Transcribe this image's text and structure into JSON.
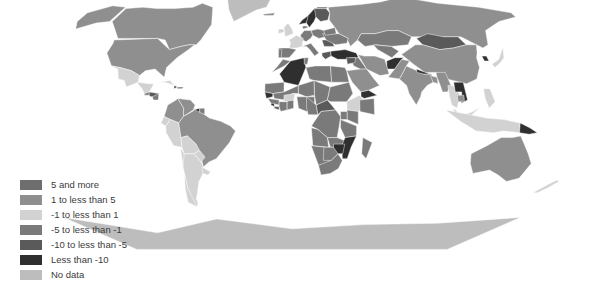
{
  "figure": {
    "title": "(Percentage)",
    "width": 609,
    "height": 292,
    "background": "#ffffff",
    "type": "choropleth-world-map",
    "projection": "robinson"
  },
  "legend": {
    "name": "map-legend",
    "items": [
      {
        "label": "5 and more",
        "color": "#6e6e6e",
        "key": "ge5"
      },
      {
        "label": "1 to less than 5",
        "color": "#8f8f8f",
        "key": "1to5"
      },
      {
        "label": "-1 to less than 1",
        "color": "#d2d2d2",
        "key": "m1to1"
      },
      {
        "label": "-5 to less than -1",
        "color": "#7a7a7a",
        "key": "m5tom1"
      },
      {
        "label": "-10 to less than -5",
        "color": "#5a5a5a",
        "key": "m10tom5"
      },
      {
        "label": "Less than -10",
        "color": "#2f2f2f",
        "key": "ltm10"
      },
      {
        "label": "No data",
        "color": "#bdbdbd",
        "key": "nodata"
      }
    ]
  },
  "chart_data": {
    "type": "heatmap",
    "title": "(Percentage)",
    "xlabel": "",
    "ylabel": "",
    "legend_position": "bottom-left",
    "grid": false,
    "color_scale": [
      {
        "bin": "5 and more",
        "color": "#6e6e6e"
      },
      {
        "bin": "1 to less than 5",
        "color": "#8f8f8f"
      },
      {
        "bin": "-1 to less than 1",
        "color": "#d2d2d2"
      },
      {
        "bin": "-5 to less than -1",
        "color": "#7a7a7a"
      },
      {
        "bin": "-10 to less than -5",
        "color": "#5a5a5a"
      },
      {
        "bin": "Less than -10",
        "color": "#2f2f2f"
      },
      {
        "bin": "No data",
        "color": "#bdbdbd"
      }
    ],
    "regions": [
      {
        "name": "Canada",
        "bin": "1 to less than 5",
        "color": "#8f8f8f"
      },
      {
        "name": "United States",
        "bin": "1 to less than 5",
        "color": "#8f8f8f"
      },
      {
        "name": "Greenland",
        "bin": "No data",
        "color": "#bdbdbd"
      },
      {
        "name": "Mexico",
        "bin": "-1 to less than 1",
        "color": "#d2d2d2"
      },
      {
        "name": "Guatemala",
        "bin": "-5 to less than -1",
        "color": "#7a7a7a"
      },
      {
        "name": "Honduras",
        "bin": "-10 to less than -5",
        "color": "#5a5a5a"
      },
      {
        "name": "Nicaragua",
        "bin": "-5 to less than -1",
        "color": "#7a7a7a"
      },
      {
        "name": "Cuba",
        "bin": "-1 to less than 1",
        "color": "#d2d2d2"
      },
      {
        "name": "Haiti",
        "bin": "Less than -10",
        "color": "#2f2f2f"
      },
      {
        "name": "Dominican Republic",
        "bin": "-5 to less than -1",
        "color": "#7a7a7a"
      },
      {
        "name": "Colombia",
        "bin": "1 to less than 5",
        "color": "#8f8f8f"
      },
      {
        "name": "Venezuela",
        "bin": "1 to less than 5",
        "color": "#8f8f8f"
      },
      {
        "name": "Guyana",
        "bin": "Less than -10",
        "color": "#2f2f2f"
      },
      {
        "name": "Suriname",
        "bin": "-5 to less than -1",
        "color": "#7a7a7a"
      },
      {
        "name": "Ecuador",
        "bin": "-1 to less than 1",
        "color": "#d2d2d2"
      },
      {
        "name": "Peru",
        "bin": "-1 to less than 1",
        "color": "#d2d2d2"
      },
      {
        "name": "Brazil",
        "bin": "1 to less than 5",
        "color": "#8f8f8f"
      },
      {
        "name": "Bolivia",
        "bin": "-1 to less than 1",
        "color": "#d2d2d2"
      },
      {
        "name": "Paraguay",
        "bin": "-1 to less than 1",
        "color": "#d2d2d2"
      },
      {
        "name": "Chile",
        "bin": "-1 to less than 1",
        "color": "#d2d2d2"
      },
      {
        "name": "Argentina",
        "bin": "-1 to less than 1",
        "color": "#d2d2d2"
      },
      {
        "name": "Uruguay",
        "bin": "-1 to less than 1",
        "color": "#d2d2d2"
      },
      {
        "name": "Iceland",
        "bin": "1 to less than 5",
        "color": "#8f8f8f"
      },
      {
        "name": "Norway",
        "bin": "Less than -10",
        "color": "#2f2f2f"
      },
      {
        "name": "Sweden",
        "bin": "Less than -10",
        "color": "#2f2f2f"
      },
      {
        "name": "Finland",
        "bin": "-10 to less than -5",
        "color": "#5a5a5a"
      },
      {
        "name": "United Kingdom",
        "bin": "-1 to less than 1",
        "color": "#d2d2d2"
      },
      {
        "name": "Ireland",
        "bin": "-1 to less than 1",
        "color": "#d2d2d2"
      },
      {
        "name": "Denmark",
        "bin": "-5 to less than -1",
        "color": "#7a7a7a"
      },
      {
        "name": "Germany",
        "bin": "-5 to less than -1",
        "color": "#7a7a7a"
      },
      {
        "name": "Poland",
        "bin": "-5 to less than -1",
        "color": "#7a7a7a"
      },
      {
        "name": "France",
        "bin": "-1 to less than 1",
        "color": "#d2d2d2"
      },
      {
        "name": "Spain",
        "bin": "-5 to less than -1",
        "color": "#7a7a7a"
      },
      {
        "name": "Portugal",
        "bin": "-5 to less than -1",
        "color": "#7a7a7a"
      },
      {
        "name": "Italy",
        "bin": "-5 to less than -1",
        "color": "#7a7a7a"
      },
      {
        "name": "Greece",
        "bin": "-10 to less than -5",
        "color": "#5a5a5a"
      },
      {
        "name": "Romania",
        "bin": "-10 to less than -5",
        "color": "#5a5a5a"
      },
      {
        "name": "Ukraine",
        "bin": "-5 to less than -1",
        "color": "#7a7a7a"
      },
      {
        "name": "Belarus",
        "bin": "-5 to less than -1",
        "color": "#7a7a7a"
      },
      {
        "name": "Turkey",
        "bin": "Less than -10",
        "color": "#2f2f2f"
      },
      {
        "name": "Russian Federation",
        "bin": "1 to less than 5",
        "color": "#8f8f8f"
      },
      {
        "name": "Kazakhstan",
        "bin": "-5 to less than -1",
        "color": "#7a7a7a"
      },
      {
        "name": "Uzbekistan",
        "bin": "-5 to less than -1",
        "color": "#7a7a7a"
      },
      {
        "name": "Mongolia",
        "bin": "-10 to less than -5",
        "color": "#5a5a5a"
      },
      {
        "name": "China",
        "bin": "1 to less than 5",
        "color": "#8f8f8f"
      },
      {
        "name": "Japan",
        "bin": "-1 to less than 1",
        "color": "#d2d2d2"
      },
      {
        "name": "Korea, Rep.",
        "bin": "Less than -10",
        "color": "#2f2f2f"
      },
      {
        "name": "India",
        "bin": "1 to less than 5",
        "color": "#8f8f8f"
      },
      {
        "name": "Pakistan",
        "bin": "1 to less than 5",
        "color": "#8f8f8f"
      },
      {
        "name": "Afghanistan",
        "bin": "Less than -10",
        "color": "#2f2f2f"
      },
      {
        "name": "Iran",
        "bin": "1 to less than 5",
        "color": "#8f8f8f"
      },
      {
        "name": "Iraq",
        "bin": "-5 to less than -1",
        "color": "#7a7a7a"
      },
      {
        "name": "Saudi Arabia",
        "bin": "1 to less than 5",
        "color": "#8f8f8f"
      },
      {
        "name": "Yemen",
        "bin": "Less than -10",
        "color": "#2f2f2f"
      },
      {
        "name": "Syria",
        "bin": "-10 to less than -5",
        "color": "#5a5a5a"
      },
      {
        "name": "Nepal",
        "bin": "Less than -10",
        "color": "#2f2f2f"
      },
      {
        "name": "Bangladesh",
        "bin": "1 to less than 5",
        "color": "#8f8f8f"
      },
      {
        "name": "Myanmar",
        "bin": "1 to less than 5",
        "color": "#8f8f8f"
      },
      {
        "name": "Thailand",
        "bin": "-1 to less than 1",
        "color": "#d2d2d2"
      },
      {
        "name": "Viet Nam",
        "bin": "Less than -10",
        "color": "#2f2f2f"
      },
      {
        "name": "Cambodia",
        "bin": "1 to less than 5",
        "color": "#8f8f8f"
      },
      {
        "name": "Malaysia",
        "bin": "-1 to less than 1",
        "color": "#d2d2d2"
      },
      {
        "name": "Indonesia",
        "bin": "-1 to less than 1",
        "color": "#d2d2d2"
      },
      {
        "name": "Philippines",
        "bin": "-1 to less than 1",
        "color": "#d2d2d2"
      },
      {
        "name": "Papua New Guinea",
        "bin": "Less than -10",
        "color": "#2f2f2f"
      },
      {
        "name": "Australia",
        "bin": "1 to less than 5",
        "color": "#8f8f8f"
      },
      {
        "name": "New Zealand",
        "bin": "-1 to less than 1",
        "color": "#d2d2d2"
      },
      {
        "name": "Morocco",
        "bin": "-5 to less than -1",
        "color": "#7a7a7a"
      },
      {
        "name": "Algeria",
        "bin": "Less than -10",
        "color": "#2f2f2f"
      },
      {
        "name": "Tunisia",
        "bin": "-5 to less than -1",
        "color": "#7a7a7a"
      },
      {
        "name": "Libya",
        "bin": "-5 to less than -1",
        "color": "#7a7a7a"
      },
      {
        "name": "Egypt",
        "bin": "-5 to less than -1",
        "color": "#7a7a7a"
      },
      {
        "name": "Mauritania",
        "bin": "-5 to less than -1",
        "color": "#7a7a7a"
      },
      {
        "name": "Mali",
        "bin": "-5 to less than -1",
        "color": "#7a7a7a"
      },
      {
        "name": "Niger",
        "bin": "-5 to less than -1",
        "color": "#7a7a7a"
      },
      {
        "name": "Chad",
        "bin": "-5 to less than -1",
        "color": "#7a7a7a"
      },
      {
        "name": "Sudan",
        "bin": "-5 to less than -1",
        "color": "#7a7a7a"
      },
      {
        "name": "Senegal",
        "bin": "Less than -10",
        "color": "#2f2f2f"
      },
      {
        "name": "Guinea",
        "bin": "-5 to less than -1",
        "color": "#7a7a7a"
      },
      {
        "name": "Sierra Leone",
        "bin": "Less than -10",
        "color": "#2f2f2f"
      },
      {
        "name": "Liberia",
        "bin": "-10 to less than -5",
        "color": "#5a5a5a"
      },
      {
        "name": "Cote d'Ivoire",
        "bin": "-5 to less than -1",
        "color": "#7a7a7a"
      },
      {
        "name": "Ghana",
        "bin": "-5 to less than -1",
        "color": "#7a7a7a"
      },
      {
        "name": "Burkina Faso",
        "bin": "-1 to less than 1",
        "color": "#d2d2d2"
      },
      {
        "name": "Nigeria",
        "bin": "-5 to less than -1",
        "color": "#7a7a7a"
      },
      {
        "name": "Cameroon",
        "bin": "-5 to less than -1",
        "color": "#7a7a7a"
      },
      {
        "name": "Central African Rep.",
        "bin": "-10 to less than -5",
        "color": "#5a5a5a"
      },
      {
        "name": "Ethiopia",
        "bin": "-1 to less than 1",
        "color": "#d2d2d2"
      },
      {
        "name": "Somalia",
        "bin": "-5 to less than -1",
        "color": "#7a7a7a"
      },
      {
        "name": "Kenya",
        "bin": "-5 to less than -1",
        "color": "#7a7a7a"
      },
      {
        "name": "Uganda",
        "bin": "-5 to less than -1",
        "color": "#7a7a7a"
      },
      {
        "name": "Congo, Dem. Rep.",
        "bin": "-5 to less than -1",
        "color": "#7a7a7a"
      },
      {
        "name": "Angola",
        "bin": "-5 to less than -1",
        "color": "#7a7a7a"
      },
      {
        "name": "Zambia",
        "bin": "-5 to less than -1",
        "color": "#7a7a7a"
      },
      {
        "name": "Tanzania",
        "bin": "-5 to less than -1",
        "color": "#7a7a7a"
      },
      {
        "name": "Mozambique",
        "bin": "Less than -10",
        "color": "#2f2f2f"
      },
      {
        "name": "Zimbabwe",
        "bin": "Less than -10",
        "color": "#2f2f2f"
      },
      {
        "name": "Madagascar",
        "bin": "-5 to less than -1",
        "color": "#7a7a7a"
      },
      {
        "name": "Namibia",
        "bin": "-5 to less than -1",
        "color": "#7a7a7a"
      },
      {
        "name": "Botswana",
        "bin": "-5 to less than -1",
        "color": "#7a7a7a"
      },
      {
        "name": "South Africa",
        "bin": "-5 to less than -1",
        "color": "#7a7a7a"
      },
      {
        "name": "Antarctica",
        "bin": "No data",
        "color": "#bdbdbd"
      }
    ]
  }
}
